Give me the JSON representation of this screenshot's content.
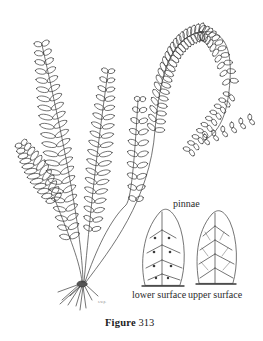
{
  "figure": {
    "caption_word": "Figure",
    "caption_number": "313",
    "artist_mark": "s.w.p."
  },
  "labels": {
    "pinnae": "pinnae",
    "lower_surface": "lower surface",
    "upper_surface": "upper surface"
  },
  "colors": {
    "ink": "#3a3a3a",
    "background": "#ffffff"
  }
}
